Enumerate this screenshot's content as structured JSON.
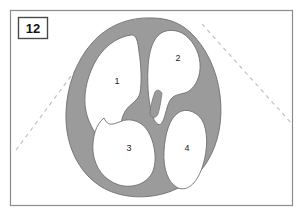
{
  "figure": {
    "panel_number": "12",
    "type": "anatomical-cross-section-diagram",
    "background_color": "#ffffff"
  },
  "frame": {
    "border_color": "#8c8c8c",
    "fill": "#ffffff"
  },
  "panel_badge": {
    "label": "12",
    "border_color": "#4a4a4a",
    "fill": "#ffffff",
    "text_color": "#141414"
  },
  "colors": {
    "tissue_gray": "#9b9b9b",
    "tissue_outline": "#6f6f6f",
    "chamber_white": "#ffffff",
    "dashed_line": "#bdbdbd",
    "label_text": "#1c1c1c"
  },
  "structures": [
    {
      "id": "chamber-1",
      "label": "1",
      "label_x": 117,
      "label_y": 84
    },
    {
      "id": "chamber-2",
      "label": "2",
      "label_x": 178,
      "label_y": 60
    },
    {
      "id": "chamber-3",
      "label": "3",
      "label_x": 129,
      "label_y": 150
    },
    {
      "id": "chamber-4",
      "label": "4",
      "label_x": 186,
      "label_y": 150
    }
  ],
  "guide_lines": [
    {
      "id": "dashed-guide-left",
      "x1": 16,
      "y1": 150,
      "x2": 78,
      "y2": 66,
      "style": "dashed"
    },
    {
      "id": "dashed-guide-right",
      "x1": 204,
      "y1": 25,
      "x2": 292,
      "y2": 124,
      "style": "dashed"
    }
  ],
  "geometry": {
    "outer_tissue_path": "M 152 18 C 120 18 98 29 84 49 C 70 69 63 96 65 122 C 67 150 79 172 98 184 C 116 195 139 196 160 192 C 182 188 201 176 212 157 C 222 139 224 116 220 94 C 216 70 205 48 189 33 C 178 23 165 18 152 18 Z",
    "chamber_1_path": "M 129 38 C 112 40 98 53 91 71 C 85 88 85 103 91 112 C 96 120 104 118 109 112 C 113 106 114 97 118 93 C 123 88 130 90 134 85 C 138 79 137 67 137 56 C 137 46 135 38 129 38 Z",
    "chamber_2_path": "M 164 34 C 152 37 147 51 146 68 C 145 84 147 97 152 104 C 157 111 164 105 168 98 C 172 91 175 84 181 82 C 188 80 195 85 198 79 C 201 71 196 57 188 47 C 180 38 172 32 164 34 Z",
    "chamber_3_path": "M 107 120 C 97 124 92 136 93 150 C 94 165 102 177 116 182 C 131 187 146 182 152 171 C 157 161 155 148 150 137 C 146 128 139 122 130 120 C 122 118 113 117 107 120 Z",
    "chamber_4_path": "M 178 116 C 168 121 163 135 163 151 C 163 167 169 180 180 184 C 191 188 200 178 204 164 C 208 149 207 132 201 123 C 195 114 186 112 178 116 Z"
  }
}
